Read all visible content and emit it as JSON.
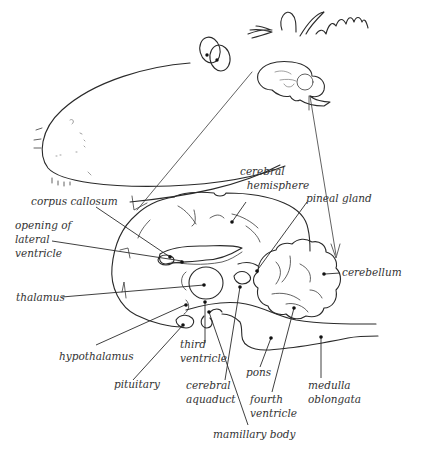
{
  "diagram": {
    "labels": {
      "cerebral_hemisphere": "cerebral\n  hemisphere",
      "corpus_callosum": "corpus callosum",
      "opening_lateral_ventricle": "opening of\nlateral\nventricle",
      "pineal_gland": "pineal gland",
      "cerebellum": "cerebellum",
      "thalamus": "thalamus",
      "hypothalamus": "hypothalamus",
      "third_ventricle": "third\nventricle",
      "pituitary": "pituitary",
      "cerebral_aquaduct": "cerebral\naquaduct",
      "pons": "pons",
      "fourth_ventricle": "fourth\nventricle",
      "medulla_oblongata": "medulla\noblongata",
      "mamillary_body": "mamillary body"
    },
    "colors": {
      "ink": "#2a2a2a",
      "background": "#ffffff"
    }
  }
}
